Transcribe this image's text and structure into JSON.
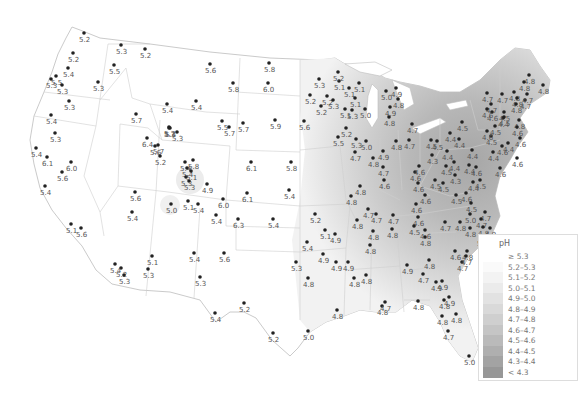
{
  "map": {
    "title": "pH",
    "legend": {
      "title": "pH",
      "items": [
        {
          "label": "≥ 5.3",
          "color": "#ffffff"
        },
        {
          "label": "5.2–5.3",
          "color": "#fafafa"
        },
        {
          "label": "5.1–5.2",
          "color": "#f3f3f3"
        },
        {
          "label": "5.0–5.1",
          "color": "#ebebeb"
        },
        {
          "label": "4.9–5.0",
          "color": "#e2e2e2"
        },
        {
          "label": "4.8–4.9",
          "color": "#d9d9d9"
        },
        {
          "label": "4.7–4.8",
          "color": "#cfcfcf"
        },
        {
          "label": "4.6–4.7",
          "color": "#c5c5c5"
        },
        {
          "label": "4.5–4.6",
          "color": "#bababa"
        },
        {
          "label": "4.4–4.5",
          "color": "#afafaf"
        },
        {
          "label": "4.3–4.4",
          "color": "#a3a3a3"
        },
        {
          "label": "< 4.3",
          "color": "#979797"
        }
      ]
    },
    "stations": [
      {
        "x": 84,
        "y": 33,
        "v": "5.2"
      },
      {
        "x": 73,
        "y": 53,
        "v": "5.2"
      },
      {
        "x": 68,
        "y": 68,
        "v": "5.4"
      },
      {
        "x": 56,
        "y": 76,
        "v": "5.5"
      },
      {
        "x": 51,
        "y": 79,
        "v": "5.3"
      },
      {
        "x": 62,
        "y": 85,
        "v": "5.3"
      },
      {
        "x": 98,
        "y": 82,
        "v": "5.3"
      },
      {
        "x": 69,
        "y": 101,
        "v": "5.3"
      },
      {
        "x": 121,
        "y": 45,
        "v": "5.3"
      },
      {
        "x": 114,
        "y": 65,
        "v": "5.5"
      },
      {
        "x": 145,
        "y": 49,
        "v": "5.2"
      },
      {
        "x": 51,
        "y": 115,
        "v": "5.4"
      },
      {
        "x": 55,
        "y": 133,
        "v": "5.3"
      },
      {
        "x": 36,
        "y": 148,
        "v": "5.4"
      },
      {
        "x": 47,
        "y": 157,
        "v": "6.1"
      },
      {
        "x": 71,
        "y": 162,
        "v": "6.0"
      },
      {
        "x": 62,
        "y": 172,
        "v": "5.6"
      },
      {
        "x": 45,
        "y": 186,
        "v": "5.4"
      },
      {
        "x": 71,
        "y": 224,
        "v": "5.1"
      },
      {
        "x": 81,
        "y": 228,
        "v": "5.6"
      },
      {
        "x": 167,
        "y": 104,
        "v": "5.4"
      },
      {
        "x": 136,
        "y": 114,
        "v": "5.7"
      },
      {
        "x": 169,
        "y": 127,
        "v": "5.7"
      },
      {
        "x": 170,
        "y": 128,
        "v": "5.4"
      },
      {
        "x": 210,
        "y": 64,
        "v": "5.6"
      },
      {
        "x": 196,
        "y": 101,
        "v": "5.4"
      },
      {
        "x": 233,
        "y": 83,
        "v": "5.8"
      },
      {
        "x": 269,
        "y": 63,
        "v": "5.8"
      },
      {
        "x": 268,
        "y": 83,
        "v": "6.0"
      },
      {
        "x": 275,
        "y": 120,
        "v": "5.9"
      },
      {
        "x": 169,
        "y": 128,
        "v": "5.3"
      },
      {
        "x": 177,
        "y": 132,
        "v": "5.3"
      },
      {
        "x": 147,
        "y": 138,
        "v": "6.4"
      },
      {
        "x": 155,
        "y": 146,
        "v": "5.6"
      },
      {
        "x": 222,
        "y": 121,
        "v": "5.5"
      },
      {
        "x": 229,
        "y": 127,
        "v": "5.7"
      },
      {
        "x": 243,
        "y": 123,
        "v": "5.7"
      },
      {
        "x": 158,
        "y": 145,
        "v": "5.7"
      },
      {
        "x": 160,
        "y": 156,
        "v": "5.2"
      },
      {
        "x": 135,
        "y": 192,
        "v": "5.6"
      },
      {
        "x": 171,
        "y": 204,
        "v": "5.0"
      },
      {
        "x": 185,
        "y": 162,
        "v": "5.4"
      },
      {
        "x": 187,
        "y": 168,
        "v": "5.4"
      },
      {
        "x": 193,
        "y": 160,
        "v": "5.8"
      },
      {
        "x": 186,
        "y": 177,
        "v": "5.3"
      },
      {
        "x": 189,
        "y": 181,
        "v": "5.3"
      },
      {
        "x": 191,
        "y": 171,
        "v": "5.1"
      },
      {
        "x": 207,
        "y": 184,
        "v": "4.9"
      },
      {
        "x": 188,
        "y": 201,
        "v": "5.1"
      },
      {
        "x": 198,
        "y": 204,
        "v": "5.4"
      },
      {
        "x": 223,
        "y": 199,
        "v": "6.0"
      },
      {
        "x": 216,
        "y": 215,
        "v": "5.4"
      },
      {
        "x": 251,
        "y": 162,
        "v": "6.1"
      },
      {
        "x": 247,
        "y": 193,
        "v": "6.1"
      },
      {
        "x": 291,
        "y": 162,
        "v": "5.8"
      },
      {
        "x": 289,
        "y": 190,
        "v": "5.4"
      },
      {
        "x": 238,
        "y": 219,
        "v": "6.3"
      },
      {
        "x": 273,
        "y": 219,
        "v": "5.4"
      },
      {
        "x": 132,
        "y": 212,
        "v": "5.4"
      },
      {
        "x": 121,
        "y": 268,
        "v": "5.2"
      },
      {
        "x": 152,
        "y": 256,
        "v": "5.1"
      },
      {
        "x": 148,
        "y": 269,
        "v": "5.3"
      },
      {
        "x": 115,
        "y": 264,
        "v": "5.4"
      },
      {
        "x": 124,
        "y": 275,
        "v": "5.3"
      },
      {
        "x": 194,
        "y": 253,
        "v": "5.4"
      },
      {
        "x": 224,
        "y": 253,
        "v": "5.6"
      },
      {
        "x": 200,
        "y": 277,
        "v": "5.3"
      },
      {
        "x": 244,
        "y": 303,
        "v": "5.2"
      },
      {
        "x": 215,
        "y": 313,
        "v": "5.4"
      },
      {
        "x": 273,
        "y": 333,
        "v": "5.2"
      },
      {
        "x": 308,
        "y": 331,
        "v": "5.0"
      },
      {
        "x": 296,
        "y": 262,
        "v": "5.3"
      },
      {
        "x": 307,
        "y": 242,
        "v": "5.4"
      },
      {
        "x": 325,
        "y": 230,
        "v": "5.1"
      },
      {
        "x": 335,
        "y": 234,
        "v": "4.9"
      },
      {
        "x": 323,
        "y": 254,
        "v": "4.9"
      },
      {
        "x": 336,
        "y": 262,
        "v": "4.9"
      },
      {
        "x": 308,
        "y": 278,
        "v": "4.8"
      },
      {
        "x": 315,
        "y": 214,
        "v": "5.2"
      },
      {
        "x": 357,
        "y": 220,
        "v": "4.8"
      },
      {
        "x": 348,
        "y": 262,
        "v": "4.9"
      },
      {
        "x": 354,
        "y": 278,
        "v": "4.8"
      },
      {
        "x": 366,
        "y": 275,
        "v": "4.8"
      },
      {
        "x": 337,
        "y": 310,
        "v": "4.8"
      },
      {
        "x": 382,
        "y": 306,
        "v": "4.8"
      },
      {
        "x": 385,
        "y": 302,
        "v": "4.7"
      },
      {
        "x": 327,
        "y": 96,
        "v": "5.2"
      },
      {
        "x": 349,
        "y": 88,
        "v": "5.1"
      },
      {
        "x": 339,
        "y": 81,
        "v": "5.1"
      },
      {
        "x": 338,
        "y": 72,
        "v": "5.2"
      },
      {
        "x": 359,
        "y": 83,
        "v": "5.1"
      },
      {
        "x": 319,
        "y": 79,
        "v": "5.3"
      },
      {
        "x": 310,
        "y": 95,
        "v": "5.2"
      },
      {
        "x": 321,
        "y": 106,
        "v": "5.2"
      },
      {
        "x": 333,
        "y": 100,
        "v": "5.3"
      },
      {
        "x": 355,
        "y": 98,
        "v": "5.1"
      },
      {
        "x": 345,
        "y": 109,
        "v": "5.1"
      },
      {
        "x": 352,
        "y": 110,
        "v": "5.3"
      },
      {
        "x": 365,
        "y": 109,
        "v": "5.0"
      },
      {
        "x": 304,
        "y": 121,
        "v": "5.6"
      },
      {
        "x": 346,
        "y": 128,
        "v": "5.2"
      },
      {
        "x": 338,
        "y": 137,
        "v": "5.5"
      },
      {
        "x": 366,
        "y": 141,
        "v": "5.0"
      },
      {
        "x": 386,
        "y": 91,
        "v": "5.0"
      },
      {
        "x": 396,
        "y": 88,
        "v": "4.9"
      },
      {
        "x": 398,
        "y": 99,
        "v": "4.8"
      },
      {
        "x": 390,
        "y": 107,
        "v": "4.9"
      },
      {
        "x": 389,
        "y": 117,
        "v": "4.8"
      },
      {
        "x": 412,
        "y": 124,
        "v": "4.7"
      },
      {
        "x": 396,
        "y": 141,
        "v": "4.8"
      },
      {
        "x": 409,
        "y": 140,
        "v": "4.7"
      },
      {
        "x": 356,
        "y": 139,
        "v": "5.3"
      },
      {
        "x": 355,
        "y": 152,
        "v": "4.7"
      },
      {
        "x": 373,
        "y": 158,
        "v": "4.8"
      },
      {
        "x": 383,
        "y": 151,
        "v": "4.9"
      },
      {
        "x": 383,
        "y": 167,
        "v": "4.7"
      },
      {
        "x": 384,
        "y": 180,
        "v": "4.6"
      },
      {
        "x": 360,
        "y": 186,
        "v": "4.8"
      },
      {
        "x": 351,
        "y": 196,
        "v": "4.8"
      },
      {
        "x": 368,
        "y": 209,
        "v": "4.7"
      },
      {
        "x": 376,
        "y": 214,
        "v": "4.7"
      },
      {
        "x": 393,
        "y": 215,
        "v": "4.7"
      },
      {
        "x": 415,
        "y": 172,
        "v": "4.6"
      },
      {
        "x": 419,
        "y": 166,
        "v": "4.6"
      },
      {
        "x": 418,
        "y": 183,
        "v": "4.6"
      },
      {
        "x": 425,
        "y": 195,
        "v": "4.6"
      },
      {
        "x": 416,
        "y": 204,
        "v": "4.6"
      },
      {
        "x": 418,
        "y": 217,
        "v": "4.6"
      },
      {
        "x": 414,
        "y": 226,
        "v": "4.5"
      },
      {
        "x": 425,
        "y": 237,
        "v": "4.8"
      },
      {
        "x": 425,
        "y": 230,
        "v": "4.6"
      },
      {
        "x": 432,
        "y": 155,
        "v": "4.3"
      },
      {
        "x": 435,
        "y": 180,
        "v": "4.5"
      },
      {
        "x": 443,
        "y": 183,
        "v": "4.5"
      },
      {
        "x": 455,
        "y": 175,
        "v": "4.3"
      },
      {
        "x": 456,
        "y": 195,
        "v": "4.5"
      },
      {
        "x": 446,
        "y": 166,
        "v": "4.5"
      },
      {
        "x": 437,
        "y": 141,
        "v": "4.5"
      },
      {
        "x": 447,
        "y": 151,
        "v": "4.4"
      },
      {
        "x": 454,
        "y": 162,
        "v": "4.4"
      },
      {
        "x": 469,
        "y": 165,
        "v": "4.4"
      },
      {
        "x": 472,
        "y": 150,
        "v": "4.4"
      },
      {
        "x": 476,
        "y": 167,
        "v": "4.6"
      },
      {
        "x": 480,
        "y": 180,
        "v": "4.5"
      },
      {
        "x": 473,
        "y": 182,
        "v": "4.4"
      },
      {
        "x": 466,
        "y": 193,
        "v": "4.6"
      },
      {
        "x": 471,
        "y": 203,
        "v": "4.5"
      },
      {
        "x": 470,
        "y": 214,
        "v": "5.0"
      },
      {
        "x": 485,
        "y": 212,
        "v": "4.7"
      },
      {
        "x": 481,
        "y": 219,
        "v": "4.7"
      },
      {
        "x": 483,
        "y": 227,
        "v": "4.8"
      },
      {
        "x": 470,
        "y": 228,
        "v": "4.8"
      },
      {
        "x": 482,
        "y": 237,
        "v": "5.1"
      },
      {
        "x": 490,
        "y": 228,
        "v": "4.9"
      },
      {
        "x": 445,
        "y": 222,
        "v": "4.7"
      },
      {
        "x": 460,
        "y": 222,
        "v": "4.8"
      },
      {
        "x": 431,
        "y": 140,
        "v": "4.5"
      },
      {
        "x": 450,
        "y": 133,
        "v": "4.4"
      },
      {
        "x": 459,
        "y": 139,
        "v": "4.4"
      },
      {
        "x": 462,
        "y": 122,
        "v": "4.5"
      },
      {
        "x": 491,
        "y": 136,
        "v": "4.5"
      },
      {
        "x": 495,
        "y": 126,
        "v": "4.5"
      },
      {
        "x": 503,
        "y": 118,
        "v": "4.4"
      },
      {
        "x": 504,
        "y": 112,
        "v": "4.5"
      },
      {
        "x": 502,
        "y": 146,
        "v": "4.6"
      },
      {
        "x": 500,
        "y": 168,
        "v": "4.6"
      },
      {
        "x": 493,
        "y": 152,
        "v": "4.4"
      },
      {
        "x": 508,
        "y": 143,
        "v": "4.4"
      },
      {
        "x": 487,
        "y": 131,
        "v": "4.6"
      },
      {
        "x": 487,
        "y": 93,
        "v": "4.7"
      },
      {
        "x": 491,
        "y": 104,
        "v": "4.7"
      },
      {
        "x": 492,
        "y": 112,
        "v": "4.6"
      },
      {
        "x": 487,
        "y": 109,
        "v": "4.6"
      },
      {
        "x": 502,
        "y": 94,
        "v": "4.7"
      },
      {
        "x": 504,
        "y": 117,
        "v": "4.5"
      },
      {
        "x": 514,
        "y": 92,
        "v": "4.8"
      },
      {
        "x": 517,
        "y": 98,
        "v": "4.8"
      },
      {
        "x": 525,
        "y": 100,
        "v": "4.7"
      },
      {
        "x": 516,
        "y": 104,
        "v": "4.8"
      },
      {
        "x": 519,
        "y": 120,
        "v": "4.8"
      },
      {
        "x": 527,
        "y": 94,
        "v": "4.7"
      },
      {
        "x": 529,
        "y": 75,
        "v": "4.8"
      },
      {
        "x": 524,
        "y": 82,
        "v": "4.8"
      },
      {
        "x": 543,
        "y": 85,
        "v": "4.8"
      },
      {
        "x": 517,
        "y": 127,
        "v": "4.6"
      },
      {
        "x": 520,
        "y": 138,
        "v": "4.6"
      },
      {
        "x": 517,
        "y": 158,
        "v": "4.6"
      },
      {
        "x": 429,
        "y": 260,
        "v": "4.8"
      },
      {
        "x": 423,
        "y": 274,
        "v": "4.7"
      },
      {
        "x": 442,
        "y": 281,
        "v": "4.9"
      },
      {
        "x": 436,
        "y": 282,
        "v": "4.9"
      },
      {
        "x": 449,
        "y": 297,
        "v": "4.9"
      },
      {
        "x": 418,
        "y": 301,
        "v": "4.8"
      },
      {
        "x": 444,
        "y": 300,
        "v": "4.8"
      },
      {
        "x": 442,
        "y": 316,
        "v": "4.8"
      },
      {
        "x": 456,
        "y": 314,
        "v": "4.8"
      },
      {
        "x": 448,
        "y": 331,
        "v": "4.7"
      },
      {
        "x": 469,
        "y": 356,
        "v": "5.0"
      },
      {
        "x": 455,
        "y": 251,
        "v": "4.6"
      },
      {
        "x": 467,
        "y": 251,
        "v": "4.8"
      },
      {
        "x": 462,
        "y": 262,
        "v": "4.7"
      },
      {
        "x": 466,
        "y": 256,
        "v": "4.7"
      },
      {
        "x": 407,
        "y": 265,
        "v": "4.9"
      },
      {
        "x": 373,
        "y": 231,
        "v": "4.8"
      },
      {
        "x": 392,
        "y": 229,
        "v": "4.8"
      },
      {
        "x": 370,
        "y": 245,
        "v": "4.8"
      }
    ]
  }
}
